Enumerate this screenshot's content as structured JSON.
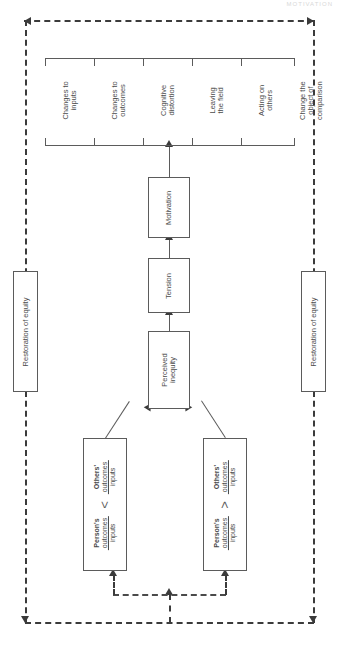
{
  "figure": {
    "header_fragment": "MOTIVATION",
    "orientation": "rotated-90",
    "ink_color": "#4b4b4b",
    "dash_color": "#3b3b3b"
  },
  "responses": {
    "items": [
      {
        "label": "Changes to\ninputs"
      },
      {
        "label": "Changes to\noutcomes"
      },
      {
        "label": "Cognitive\ndistortion"
      },
      {
        "label": "Leaving\nthe field"
      },
      {
        "label": "Acting on\nothers"
      },
      {
        "label": "Change the\nobject of\ncomparison"
      }
    ]
  },
  "chain": {
    "motivation": "Motivation",
    "tension": "Tension",
    "perceived_inequity": "Perceived\ninequity"
  },
  "restoration": {
    "left": "Restoration of equity",
    "right": "Restoration of equity"
  },
  "comparisons": [
    {
      "id": "under-reward",
      "person_label": "Person's",
      "person_num": "outcomes",
      "person_den": "inputs",
      "operator": "<",
      "other_label": "Others'",
      "other_num": "outcomes",
      "other_den": "inputs"
    },
    {
      "id": "over-reward",
      "person_label": "Person's",
      "person_num": "outcomes",
      "person_den": "inputs",
      "operator": ">",
      "other_label": "Others'",
      "other_num": "outcomes",
      "other_den": "inputs"
    }
  ]
}
